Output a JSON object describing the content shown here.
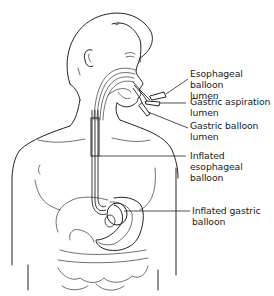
{
  "figure": {
    "labels": [
      {
        "id": "esophageal-balloon-lumen",
        "text": "Esophageal balloon\nlumen"
      },
      {
        "id": "gastric-aspiration-lumen",
        "text": "Gastric aspiration\nlumen"
      },
      {
        "id": "gastric-balloon-lumen",
        "text": "Gastric balloon\nlumen"
      },
      {
        "id": "inflated-esophageal-balloon",
        "text": "Inflated esophageal\nballoon"
      },
      {
        "id": "inflated-gastric-balloon",
        "text": "Inflated gastric\nballoon"
      }
    ]
  },
  "colors": {
    "line": "#222222",
    "background": "#ffffff",
    "text": "#1a1a1a"
  }
}
